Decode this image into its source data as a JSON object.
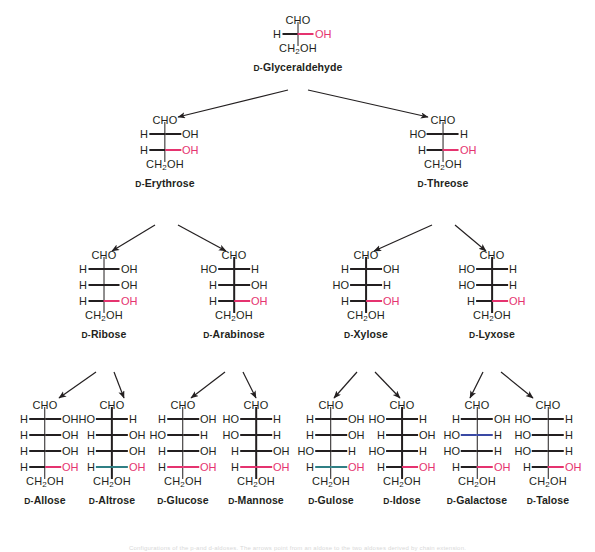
{
  "figure": {
    "caption": "Configurations of the p-and d-aldoses. The arrows point from an aldose to the two aldoses derived by chain extension.",
    "colors": {
      "text": "#231f20",
      "pink": "#e5336f",
      "teal": "#2f7f84",
      "blue": "#3a49a4",
      "background": "#ffffff"
    },
    "labels": {
      "cho": "CHO",
      "ch2oh_pre": "CH",
      "ch2oh_sub": "2",
      "ch2oh_post": "OH",
      "h": "H",
      "oh": "OH",
      "ho": "HO",
      "d_prefix": "D-"
    }
  },
  "molecules": [
    {
      "id": "d-glyceraldehyde",
      "name": "D-Glyceraldehyde",
      "name_stem": "Glyceraldehyde",
      "x": 298,
      "y": 14,
      "top": "CHO",
      "bottom": "CH2OH",
      "rows": [
        {
          "left": "H",
          "right": "OH",
          "color": "pink",
          "bond": "black"
        }
      ]
    },
    {
      "id": "d-erythrose",
      "name": "D-Erythrose",
      "name_stem": "Erythrose",
      "x": 165,
      "y": 114,
      "top": "CHO",
      "bottom": "CH2OH",
      "rows": [
        {
          "left": "H",
          "right": "OH",
          "color": "black",
          "bond": "black"
        },
        {
          "left": "H",
          "right": "OH",
          "color": "pink",
          "bond": "black"
        }
      ]
    },
    {
      "id": "d-threose",
      "name": "D-Threose",
      "name_stem": "Threose",
      "x": 443,
      "y": 114,
      "top": "CHO",
      "bottom": "CH2OH",
      "rows": [
        {
          "left": "HO",
          "right": "H",
          "color": "black",
          "bond": "black"
        },
        {
          "left": "H",
          "right": "OH",
          "color": "pink",
          "bond": "black"
        }
      ]
    },
    {
      "id": "d-ribose",
      "name": "D-Ribose",
      "name_stem": "Ribose",
      "x": 104,
      "y": 249,
      "top": "CHO",
      "bottom": "CH2OH",
      "rows": [
        {
          "left": "H",
          "right": "OH",
          "color": "black",
          "bond": "black"
        },
        {
          "left": "H",
          "right": "OH",
          "color": "black",
          "bond": "black"
        },
        {
          "left": "H",
          "right": "OH",
          "color": "pink",
          "bond": "black"
        }
      ]
    },
    {
      "id": "d-arabinose",
      "name": "D-Arabinose",
      "name_stem": "Arabinose",
      "x": 234,
      "y": 249,
      "top": "CHO",
      "bottom": "CH2OH",
      "rows": [
        {
          "left": "HO",
          "right": "H",
          "color": "black",
          "bond": "black"
        },
        {
          "left": "H",
          "right": "OH",
          "color": "black",
          "bond": "black"
        },
        {
          "left": "H",
          "right": "OH",
          "color": "pink",
          "bond": "black"
        }
      ]
    },
    {
      "id": "d-xylose",
      "name": "D-Xylose",
      "name_stem": "Xylose",
      "x": 366,
      "y": 249,
      "top": "CHO",
      "bottom": "CH2OH",
      "rows": [
        {
          "left": "H",
          "right": "OH",
          "color": "black",
          "bond": "black"
        },
        {
          "left": "HO",
          "right": "H",
          "color": "black",
          "bond": "black"
        },
        {
          "left": "H",
          "right": "OH",
          "color": "pink",
          "bond": "black"
        }
      ]
    },
    {
      "id": "d-lyxose",
      "name": "D-Lyxose",
      "name_stem": "Lyxose",
      "x": 492,
      "y": 249,
      "top": "CHO",
      "bottom": "CH2OH",
      "rows": [
        {
          "left": "HO",
          "right": "H",
          "color": "black",
          "bond": "black"
        },
        {
          "left": "HO",
          "right": "H",
          "color": "black",
          "bond": "black"
        },
        {
          "left": "H",
          "right": "OH",
          "color": "pink",
          "bond": "black"
        }
      ]
    },
    {
      "id": "d-allose",
      "name": "D-Allose",
      "name_stem": "Allose",
      "x": 45,
      "y": 399,
      "top": "CHO",
      "bottom": "CH2OH",
      "rows": [
        {
          "left": "H",
          "right": "OH",
          "color": "black",
          "bond": "black"
        },
        {
          "left": "H",
          "right": "OH",
          "color": "black",
          "bond": "black"
        },
        {
          "left": "H",
          "right": "OH",
          "color": "black",
          "bond": "black"
        },
        {
          "left": "H",
          "right": "OH",
          "color": "pink",
          "bond": "black"
        }
      ]
    },
    {
      "id": "d-altrose",
      "name": "D-Altrose",
      "name_stem": "Altrose",
      "x": 112,
      "y": 399,
      "top": "CHO",
      "bottom": "CH2OH",
      "rows": [
        {
          "left": "HO",
          "right": "H",
          "color": "black",
          "bond": "black"
        },
        {
          "left": "H",
          "right": "OH",
          "color": "black",
          "bond": "black"
        },
        {
          "left": "H",
          "right": "OH",
          "color": "black",
          "bond": "black"
        },
        {
          "left": "H",
          "right": "OH",
          "color": "pink",
          "bond": "teal"
        }
      ]
    },
    {
      "id": "d-glucose",
      "name": "D-Glucose",
      "name_stem": "Glucose",
      "x": 183,
      "y": 399,
      "top": "CHO",
      "bottom": "CH2OH",
      "rows": [
        {
          "left": "H",
          "right": "OH",
          "color": "black",
          "bond": "black"
        },
        {
          "left": "HO",
          "right": "H",
          "color": "black",
          "bond": "black"
        },
        {
          "left": "H",
          "right": "OH",
          "color": "black",
          "bond": "black"
        },
        {
          "left": "H",
          "right": "OH",
          "color": "pink",
          "bond": "pink"
        }
      ]
    },
    {
      "id": "d-mannose",
      "name": "D-Mannose",
      "name_stem": "Mannose",
      "x": 256,
      "y": 399,
      "top": "CHO",
      "bottom": "CH2OH",
      "rows": [
        {
          "left": "HO",
          "right": "H",
          "color": "black",
          "bond": "black"
        },
        {
          "left": "HO",
          "right": "H",
          "color": "black",
          "bond": "black"
        },
        {
          "left": "H",
          "right": "OH",
          "color": "black",
          "bond": "black"
        },
        {
          "left": "H",
          "right": "OH",
          "color": "pink",
          "bond": "pink"
        }
      ]
    },
    {
      "id": "d-gulose",
      "name": "D-Gulose",
      "name_stem": "Gulose",
      "x": 331,
      "y": 399,
      "top": "CHO",
      "bottom": "CH2OH",
      "rows": [
        {
          "left": "H",
          "right": "OH",
          "color": "black",
          "bond": "black"
        },
        {
          "left": "H",
          "right": "OH",
          "color": "black",
          "bond": "black"
        },
        {
          "left": "HO",
          "right": "H",
          "color": "black",
          "bond": "black"
        },
        {
          "left": "H",
          "right": "OH",
          "color": "pink",
          "bond": "teal"
        }
      ]
    },
    {
      "id": "d-idose",
      "name": "D-Idose",
      "name_stem": "Idose",
      "x": 402,
      "y": 399,
      "top": "CHO",
      "bottom": "CH2OH",
      "rows": [
        {
          "left": "HO",
          "right": "H",
          "color": "black",
          "bond": "black"
        },
        {
          "left": "H",
          "right": "OH",
          "color": "black",
          "bond": "black"
        },
        {
          "left": "HO",
          "right": "H",
          "color": "black",
          "bond": "black"
        },
        {
          "left": "H",
          "right": "OH",
          "color": "pink",
          "bond": "black"
        }
      ]
    },
    {
      "id": "d-galactose",
      "name": "D-Galactose",
      "name_stem": "Galactose",
      "x": 477,
      "y": 399,
      "top": "CHO",
      "bottom": "CH2OH",
      "rows": [
        {
          "left": "H",
          "right": "OH",
          "color": "black",
          "bond": "black"
        },
        {
          "left": "HO",
          "right": "H",
          "color": "black",
          "bond": "blue"
        },
        {
          "left": "HO",
          "right": "H",
          "color": "black",
          "bond": "black"
        },
        {
          "left": "H",
          "right": "OH",
          "color": "pink",
          "bond": "black"
        }
      ]
    },
    {
      "id": "d-talose",
      "name": "D-Talose",
      "name_stem": "Talose",
      "x": 548,
      "y": 399,
      "top": "CHO",
      "bottom": "CH2OH",
      "rows": [
        {
          "left": "HO",
          "right": "H",
          "color": "black",
          "bond": "black"
        },
        {
          "left": "HO",
          "right": "H",
          "color": "black",
          "bond": "black"
        },
        {
          "left": "HO",
          "right": "H",
          "color": "black",
          "bond": "black"
        },
        {
          "left": "H",
          "right": "OH",
          "color": "pink",
          "bond": "black"
        }
      ]
    }
  ],
  "arrows": [
    {
      "from": "d-glyceraldehyde",
      "to": "d-erythrose",
      "x1": 288,
      "y1": 90,
      "x2": 178,
      "y2": 117
    },
    {
      "from": "d-glyceraldehyde",
      "to": "d-threose",
      "x1": 308,
      "y1": 90,
      "x2": 428,
      "y2": 117
    },
    {
      "from": "d-erythrose",
      "to": "d-ribose",
      "x1": 155,
      "y1": 225,
      "x2": 112,
      "y2": 251
    },
    {
      "from": "d-erythrose",
      "to": "d-arabinose",
      "x1": 178,
      "y1": 225,
      "x2": 226,
      "y2": 251
    },
    {
      "from": "d-threose",
      "to": "d-xylose",
      "x1": 432,
      "y1": 225,
      "x2": 374,
      "y2": 251
    },
    {
      "from": "d-threose",
      "to": "d-lyxose",
      "x1": 455,
      "y1": 225,
      "x2": 486,
      "y2": 251
    },
    {
      "from": "d-ribose",
      "to": "d-allose",
      "x1": 96,
      "y1": 372,
      "x2": 59,
      "y2": 398
    },
    {
      "from": "d-ribose",
      "to": "d-altrose",
      "x1": 114,
      "y1": 372,
      "x2": 124,
      "y2": 398
    },
    {
      "from": "d-arabinose",
      "to": "d-glucose",
      "x1": 225,
      "y1": 372,
      "x2": 191,
      "y2": 398
    },
    {
      "from": "d-arabinose",
      "to": "d-mannose",
      "x1": 243,
      "y1": 372,
      "x2": 256,
      "y2": 398
    },
    {
      "from": "d-xylose",
      "to": "d-gulose",
      "x1": 357,
      "y1": 372,
      "x2": 334,
      "y2": 398
    },
    {
      "from": "d-xylose",
      "to": "d-idose",
      "x1": 375,
      "y1": 372,
      "x2": 400,
      "y2": 398
    },
    {
      "from": "d-lyxose",
      "to": "d-galactose",
      "x1": 483,
      "y1": 372,
      "x2": 470,
      "y2": 398
    },
    {
      "from": "d-lyxose",
      "to": "d-talose",
      "x1": 501,
      "y1": 372,
      "x2": 533,
      "y2": 398
    }
  ]
}
